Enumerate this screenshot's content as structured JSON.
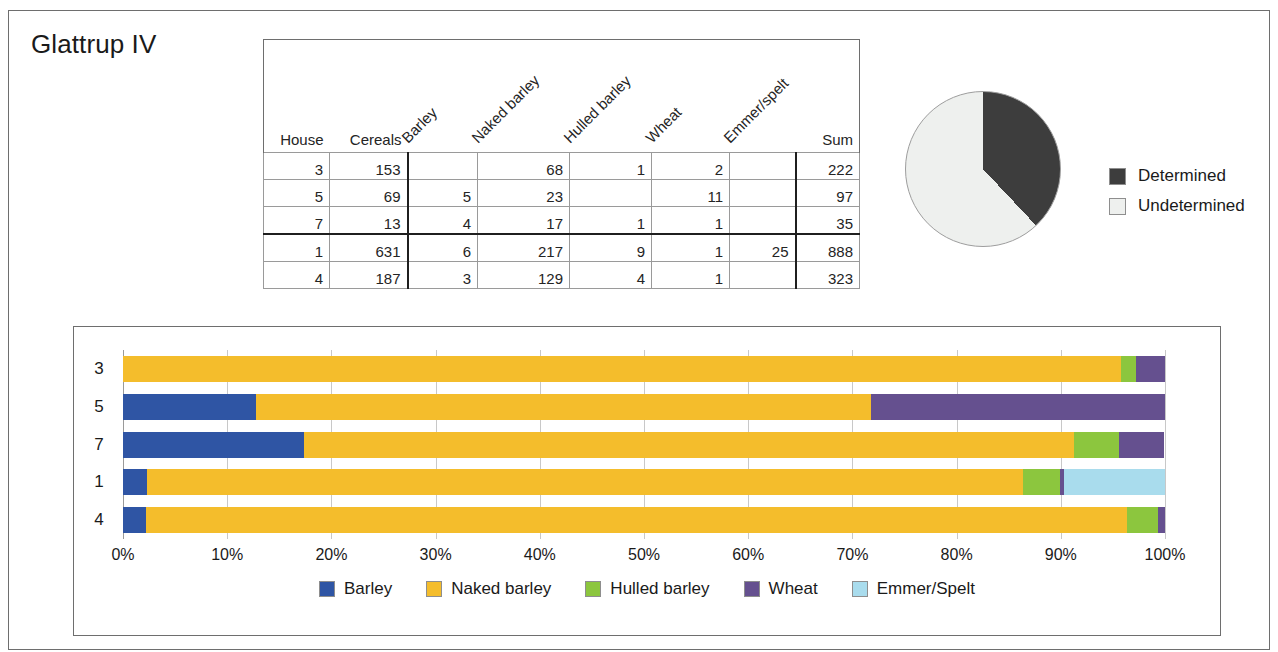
{
  "title": "Glattrup IV",
  "table": {
    "headers": [
      {
        "label": "House",
        "rotated": false
      },
      {
        "label": "Cereals",
        "rotated": false
      },
      {
        "label": "Barley",
        "rotated": true
      },
      {
        "label": "Naked barley",
        "rotated": true
      },
      {
        "label": "Hulled barley",
        "rotated": true
      },
      {
        "label": "Wheat",
        "rotated": true
      },
      {
        "label": "Emmer/spelt",
        "rotated": true
      },
      {
        "label": "Sum",
        "rotated": false
      }
    ],
    "rows": [
      {
        "house": "3",
        "cereals": "153",
        "barley": "",
        "naked_barley": "68",
        "hulled_barley": "1",
        "wheat": "2",
        "emmer_spelt": "",
        "sum": "222",
        "group": 1
      },
      {
        "house": "5",
        "cereals": "69",
        "barley": "5",
        "naked_barley": "23",
        "hulled_barley": "",
        "wheat": "11",
        "emmer_spelt": "",
        "sum": "97",
        "group": 1
      },
      {
        "house": "7",
        "cereals": "13",
        "barley": "4",
        "naked_barley": "17",
        "hulled_barley": "1",
        "wheat": "1",
        "emmer_spelt": "",
        "sum": "35",
        "group": 1
      },
      {
        "house": "1",
        "cereals": "631",
        "barley": "6",
        "naked_barley": "217",
        "hulled_barley": "9",
        "wheat": "1",
        "emmer_spelt": "25",
        "sum": "888",
        "group": 2
      },
      {
        "house": "4",
        "cereals": "187",
        "barley": "3",
        "naked_barley": "129",
        "hulled_barley": "4",
        "wheat": "1",
        "emmer_spelt": "",
        "sum": "323",
        "group": 2
      }
    ]
  },
  "pie_legend": [
    {
      "label": "Determined",
      "color": "#3d3d3d"
    },
    {
      "label": "Undetermined",
      "color": "#eef0ee"
    }
  ],
  "colors": {
    "barley": "#2f55a4",
    "naked_barley": "#f4bd2c",
    "hulled_barley": "#8cc63e",
    "wheat": "#65508f",
    "emmer_spelt": "#a9dced",
    "determined": "#3d3d3d",
    "undetermined": "#eef0ee",
    "gridline": "#c8c8c8",
    "frame": "#6e6e6e"
  },
  "chart_data": [
    {
      "type": "pie",
      "title": "",
      "labels": [
        "Determined",
        "Undetermined"
      ],
      "values": [
        38,
        62
      ],
      "colors": [
        "#3d3d3d",
        "#eef0ee"
      ],
      "legend_position": "right",
      "start_angle_deg": 0,
      "direction": "clockwise"
    },
    {
      "type": "bar",
      "orientation": "horizontal",
      "stacked": true,
      "normalized": true,
      "title": "",
      "xlabel": "",
      "ylabel": "",
      "xlim": [
        0,
        100
      ],
      "xticks": [
        "0%",
        "10%",
        "20%",
        "30%",
        "40%",
        "50%",
        "60%",
        "70%",
        "80%",
        "90%",
        "100%"
      ],
      "grid": true,
      "legend_position": "bottom",
      "categories": [
        "3",
        "5",
        "7",
        "1",
        "4"
      ],
      "series": [
        {
          "name": "Barley",
          "color": "#2f55a4",
          "values": [
            0.0,
            12.8,
            17.4,
            2.3,
            2.2
          ]
        },
        {
          "name": "Naked barley",
          "color": "#f4bd2c",
          "values": [
            95.8,
            59.0,
            73.9,
            84.1,
            94.2
          ]
        },
        {
          "name": "Hulled barley",
          "color": "#8cc63e",
          "values": [
            1.4,
            0.0,
            4.3,
            3.5,
            2.9
          ]
        },
        {
          "name": "Wheat",
          "color": "#65508f",
          "values": [
            2.8,
            28.2,
            4.3,
            0.4,
            0.7
          ]
        },
        {
          "name": "Emmer/Spelt",
          "color": "#a9dced",
          "values": [
            0.0,
            0.0,
            0.0,
            9.7,
            0.0
          ]
        }
      ]
    }
  ],
  "bar_legend": [
    {
      "label": "Barley",
      "color": "#2f55a4"
    },
    {
      "label": "Naked barley",
      "color": "#f4bd2c"
    },
    {
      "label": "Hulled barley",
      "color": "#8cc63e"
    },
    {
      "label": "Wheat",
      "color": "#65508f"
    },
    {
      "label": "Emmer/Spelt",
      "color": "#a9dced"
    }
  ]
}
